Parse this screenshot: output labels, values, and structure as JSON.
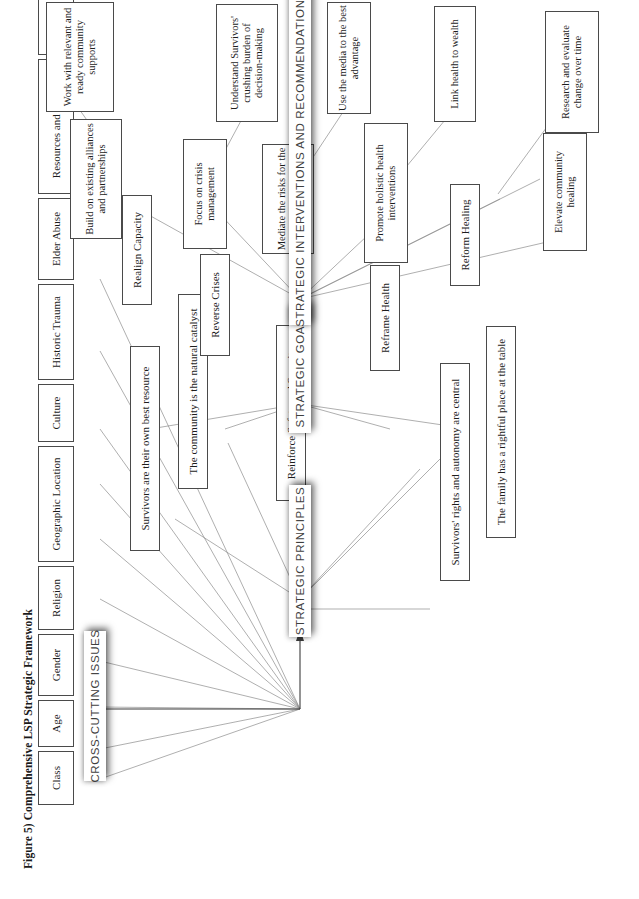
{
  "figure": {
    "title": "Figure 5) Comprehensive LSP Strategic Framework",
    "orientation": "landscape-rotated-90-ccw",
    "page_size": {
      "width": 639,
      "height": 899
    }
  },
  "bands": {
    "cross_cutting": "CROSS-CUTTING ISSUES",
    "principles": "STRATEGIC PRINCIPLES",
    "goals": "STRATEGIC GOALS",
    "interventions": "STRATEGIC INTERVENTIONS AND RECOMMENDATIONS"
  },
  "cross_cutting_issues": [
    {
      "label": "Class"
    },
    {
      "label": "Age"
    },
    {
      "label": "Gender"
    },
    {
      "label": "Religion"
    },
    {
      "label": "Geographic Location"
    },
    {
      "label": "Culture"
    },
    {
      "label": "Historic Trauma"
    },
    {
      "label": "Elder Abuse"
    },
    {
      "label": "Resources and Funding"
    },
    {
      "label": "Research"
    }
  ],
  "strategic_principles": [
    {
      "label": "Survivors' rights and autonomy are central"
    },
    {
      "label": "The family has a rightful place at the table"
    },
    {
      "label": "Survivors are their own best resource"
    },
    {
      "label": "The community is the natural catalyst"
    }
  ],
  "strategic_goals": [
    {
      "label": "Reform Healing"
    },
    {
      "label": "Reframe Health"
    },
    {
      "label": "Reinforce Safety and Security"
    },
    {
      "label": "Reverse Crises"
    },
    {
      "label": "Realign Capacity"
    }
  ],
  "strategic_interventions": [
    {
      "label": "Elevate community healing"
    },
    {
      "label": "Promote holistic health interventions"
    },
    {
      "label": "Mediate the risks for the most vulnerable"
    },
    {
      "label": "Focus on crisis management"
    },
    {
      "label": "Build on existing alliances and partnerships"
    }
  ],
  "recommendations": [
    {
      "label": "Research and evaluate change over time"
    },
    {
      "label": "Link health to wealth"
    },
    {
      "label": "Use the media to the best advantage"
    },
    {
      "label": "Understand Survivors' crushing burden of decision-making"
    },
    {
      "label": "Work with relevant and ready community supports"
    }
  ],
  "colors": {
    "page_background": "#ffffff",
    "node_border": "#4a4a4a",
    "node_text": "#1d1d1d",
    "band_text": "#3f3f3f",
    "connector": "#8d8d8d",
    "flow_arrow": "#3c3c3c"
  }
}
